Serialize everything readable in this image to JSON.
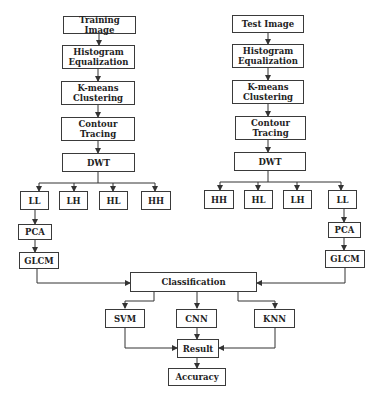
{
  "diagram": {
    "left_pipeline": {
      "training_image": "Training Image",
      "histogram_eq_line1": "Histogram",
      "histogram_eq_line2": "Equalization",
      "kmeans_line1": "K-means",
      "kmeans_line2": "Clustering",
      "contour_line1": "Contour",
      "contour_line2": "Tracing",
      "dwt": "DWT",
      "subbands": [
        "LL",
        "LH",
        "HL",
        "HH"
      ],
      "pca": "PCA",
      "glcm": "GLCM"
    },
    "right_pipeline": {
      "test_image": "Test Image",
      "histogram_eq_line1": "Histogram",
      "histogram_eq_line2": "Equalization",
      "kmeans_line1": "K-means",
      "kmeans_line2": "Clustering",
      "contour_line1": "Contour",
      "contour_line2": "Tracing",
      "dwt": "DWT",
      "subbands": [
        "HH",
        "HL",
        "LH",
        "LL"
      ],
      "pca": "PCA",
      "glcm": "GLCM"
    },
    "classification": "Classification",
    "classifiers": [
      "SVM",
      "CNN",
      "KNN"
    ],
    "result": "Result",
    "accuracy": "Accuracy"
  }
}
